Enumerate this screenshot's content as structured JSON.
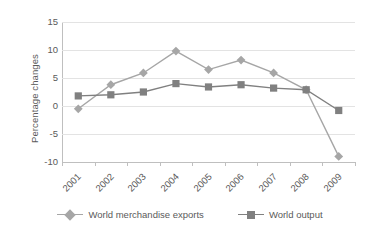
{
  "chart_data": {
    "type": "line",
    "title": "",
    "subtitle": "",
    "xlabel": "",
    "ylabel": "Percentage changes",
    "categories": [
      "2001",
      "2002",
      "2003",
      "2004",
      "2005",
      "2006",
      "2007",
      "2008",
      "2009"
    ],
    "ylim": [
      -10,
      15
    ],
    "yticks": [
      15,
      10,
      5,
      0,
      -5,
      -10
    ],
    "ytick_labels": [
      "15",
      "10",
      "5",
      "0",
      "-5",
      "-10"
    ],
    "grid": true,
    "legend_position": "bottom",
    "series": [
      {
        "name": "World merchandise exports",
        "marker": "diamond",
        "color": "#a6a6a6",
        "values": [
          -0.5,
          3.8,
          5.9,
          9.8,
          6.5,
          8.2,
          5.9,
          2.9,
          -9.0
        ]
      },
      {
        "name": "World output",
        "marker": "square",
        "color": "#808080",
        "values": [
          1.8,
          2.0,
          2.5,
          4.0,
          3.4,
          3.8,
          3.2,
          2.9,
          -0.8
        ]
      }
    ]
  },
  "style": {
    "grid_color": "#e3e3e3",
    "axis_color": "#bfbfbf",
    "text_color": "#5a5a5a",
    "background": "#ffffff"
  }
}
